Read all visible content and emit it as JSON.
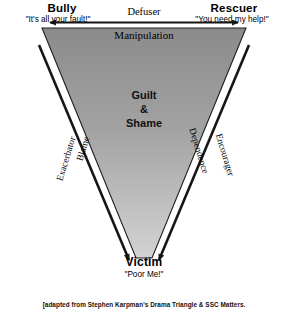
{
  "diagram": {
    "title_note": "Karpman Drama Triangle",
    "roles": {
      "bully": {
        "name": "Bully",
        "quote": "\"It's all your fault!\""
      },
      "rescuer": {
        "name": "Rescuer",
        "quote": "\"You need my help!\""
      },
      "victim": {
        "name": "Victim",
        "quote": "\"Poor Me!\""
      }
    },
    "edges": {
      "top_outer": "Defuser",
      "top_inner": "Manipulation",
      "left_outer": "Exacerbator",
      "left_inner": "Blame",
      "right_inner": "Dependence",
      "right_outer": "Encourager"
    },
    "center": {
      "line1": "Guilt",
      "line2": "&",
      "line3": "Shame"
    },
    "footer": "[adapted from Stephen Karpman's Drama Triangle & SSC Matters.",
    "colors": {
      "background": "#ffffff",
      "triangle_fill_top": "#8e8e8e",
      "triangle_fill_bottom": "#c9c9c9",
      "triangle_stroke": "#1a1a1a",
      "arrow": "#161616",
      "text": "#000000"
    }
  }
}
